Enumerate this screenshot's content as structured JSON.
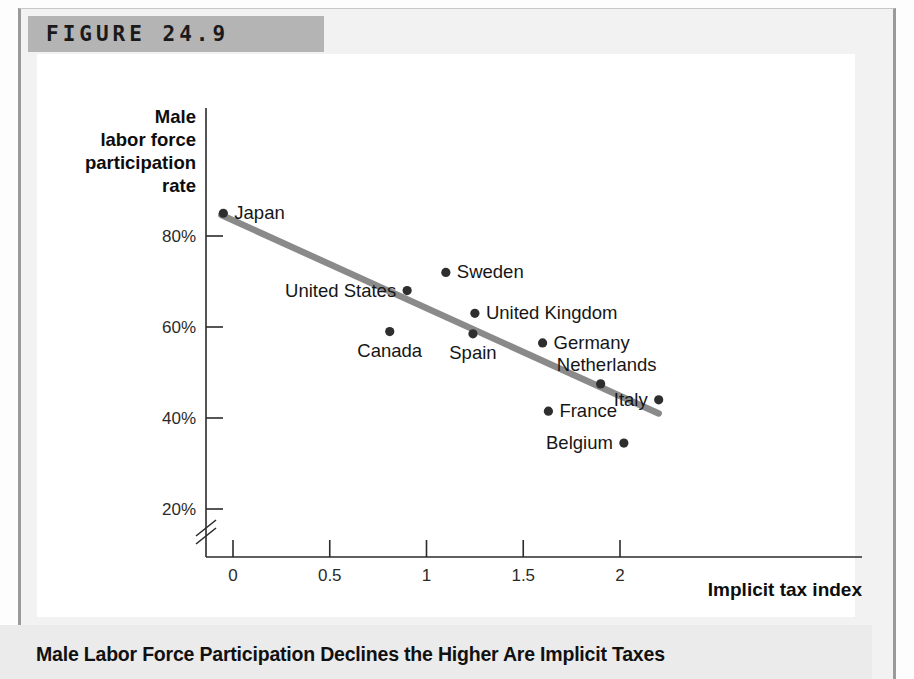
{
  "figure": {
    "label": "FIGURE 24.9",
    "caption": "Male Labor Force Participation Declines the Higher Are Implicit Taxes"
  },
  "chart_data": {
    "type": "scatter",
    "title": "",
    "xlabel": "Implicit tax index",
    "ylabel": "Male labor force participation rate",
    "ylabel_lines": [
      "Male",
      "labor force",
      "participation",
      "rate"
    ],
    "xlim": [
      -0.2,
      2.3
    ],
    "ylim": [
      15,
      92
    ],
    "grid": false,
    "legend": "none",
    "y_axis_break": true,
    "xticks": [
      0,
      0.5,
      1,
      1.5,
      2
    ],
    "xtick_labels": [
      "0",
      "0.5",
      "1",
      "1.5",
      "2"
    ],
    "yticks": [
      20,
      40,
      60,
      80
    ],
    "ytick_labels": [
      "20%",
      "40%",
      "60%",
      "80%"
    ],
    "points": [
      {
        "name": "Japan",
        "x": -0.05,
        "y": 85.0,
        "label_side": "right"
      },
      {
        "name": "United States",
        "x": 0.9,
        "y": 68.0,
        "label_side": "left"
      },
      {
        "name": "Canada",
        "x": 0.81,
        "y": 59.0,
        "label_side": "below"
      },
      {
        "name": "Sweden",
        "x": 1.1,
        "y": 72.0,
        "label_side": "right"
      },
      {
        "name": "United Kingdom",
        "x": 1.25,
        "y": 63.0,
        "label_side": "right"
      },
      {
        "name": "Spain",
        "x": 1.24,
        "y": 58.5,
        "label_side": "below"
      },
      {
        "name": "Germany",
        "x": 1.6,
        "y": 56.5,
        "label_side": "right"
      },
      {
        "name": "Netherlands",
        "x": 1.9,
        "y": 47.5,
        "label_side": "above"
      },
      {
        "name": "Italy",
        "x": 2.2,
        "y": 44.0,
        "label_side": "left"
      },
      {
        "name": "France",
        "x": 1.63,
        "y": 41.5,
        "label_side": "right"
      },
      {
        "name": "Belgium",
        "x": 2.02,
        "y": 34.5,
        "label_side": "left"
      }
    ],
    "trendline": {
      "name": "fitted trend",
      "x0": -0.06,
      "y0": 84.6,
      "x1": 2.2,
      "y1": 41.0,
      "color": "#8a8a8a"
    }
  },
  "colors": {
    "band": "#b4b4b4",
    "frame": "#9a9a9a",
    "trend": "#8a8a8a",
    "point": "#2e2e2e",
    "axis": "#2b2b2b",
    "caption_bg": "#ebebeb"
  }
}
